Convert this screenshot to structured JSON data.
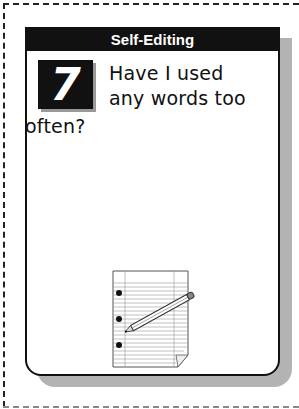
{
  "card": {
    "header": "Self-Editing",
    "number": "7",
    "question_lines": [
      "Have I used",
      "any words too",
      "often?"
    ],
    "illustration": "notepad-with-pencil-icon"
  }
}
